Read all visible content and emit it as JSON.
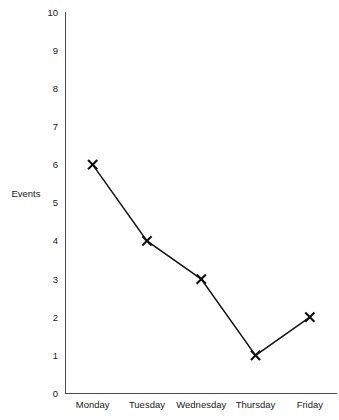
{
  "chart_data": {
    "type": "line",
    "title": "",
    "title_note": "title row is clipped by the top image edge and is illegible",
    "categories": [
      "Monday",
      "Tuesday",
      "Wednesday",
      "Thursday",
      "Friday"
    ],
    "values": [
      6,
      4,
      3,
      1,
      2
    ],
    "series": [
      {
        "name": "Events",
        "values": [
          6,
          4,
          3,
          1,
          2
        ]
      }
    ],
    "xlabel": "",
    "ylabel": "Events",
    "ylim": [
      0,
      10
    ],
    "ytick_labels": [
      "0",
      "1",
      "2",
      "3",
      "4",
      "5",
      "6",
      "7",
      "8",
      "9",
      "10"
    ],
    "ytick_values": [
      0,
      1,
      2,
      3,
      4,
      5,
      6,
      7,
      8,
      9,
      10
    ],
    "grid": false,
    "legend": false,
    "legend_position": "none",
    "marker": "x",
    "line_color": "#151515",
    "marker_color": "#101010",
    "axis_color": "#4a4a4a",
    "background_color": "#ffffff",
    "annotations": []
  }
}
